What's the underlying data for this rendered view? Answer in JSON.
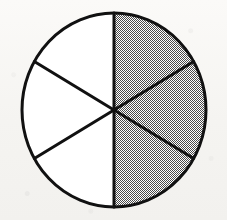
{
  "figure": {
    "background_color": "#f8f7f5"
  },
  "chart_data": {
    "type": "pie",
    "title": "",
    "subtitle": "",
    "xlabel": "",
    "ylabel": "",
    "legend": [],
    "annotations": [],
    "grid": false,
    "total_slices": 6,
    "shaded_slices": 3,
    "fraction_shaded": "3/6",
    "fraction_simplified": "1/2",
    "percent_shaded": 50,
    "slice_angle_degrees": 60,
    "categories": [
      "sector-1",
      "sector-2",
      "sector-3",
      "sector-4",
      "sector-5",
      "sector-6"
    ],
    "values": [
      1,
      1,
      1,
      1,
      1,
      1
    ],
    "series": [
      {
        "name": "sectors",
        "values": [
          1,
          1,
          1,
          1,
          1,
          1
        ]
      }
    ],
    "slices": [
      {
        "id": "sector-1",
        "start_angle": 0,
        "end_angle": 60,
        "shaded": true,
        "position": "upper-right"
      },
      {
        "id": "sector-2",
        "start_angle": 60,
        "end_angle": 120,
        "shaded": true,
        "position": "right"
      },
      {
        "id": "sector-3",
        "start_angle": 120,
        "end_angle": 180,
        "shaded": true,
        "position": "lower-right"
      },
      {
        "id": "sector-4",
        "start_angle": 180,
        "end_angle": 240,
        "shaded": false,
        "position": "lower-left"
      },
      {
        "id": "sector-5",
        "start_angle": 240,
        "end_angle": 300,
        "shaded": false,
        "position": "left"
      },
      {
        "id": "sector-6",
        "start_angle": 300,
        "end_angle": 360,
        "shaded": false,
        "position": "upper-left"
      }
    ],
    "geometry": {
      "center_x": 114,
      "center_y": 110,
      "radius_x": 92,
      "radius_y": 97,
      "stroke_width": 3
    },
    "colors": {
      "shaded_fill": "#a9a9a9",
      "unshaded_fill": "#ffffff",
      "stroke": "#111111",
      "background": "#f8f7f5"
    }
  }
}
